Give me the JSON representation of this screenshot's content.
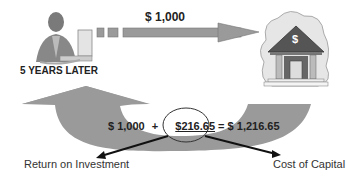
{
  "diagram": {
    "top_arrow_label": "$ 1,000",
    "person_caption": "5 YEARS LATER",
    "bank_symbol": "$",
    "equation": {
      "principal": "$ 1,000",
      "plus": "+",
      "interest": "$216.65",
      "equals": "=",
      "total": "$ 1,216.65"
    },
    "left_pointer_label": "Return on Investment",
    "right_pointer_label": "Cost of Capital",
    "icons": [
      "person-at-computer-icon",
      "bank-icon"
    ],
    "colors": {
      "arrow_fill": "#9a9a9a",
      "text": "#222222",
      "ellipse_stroke": "#333333"
    }
  }
}
